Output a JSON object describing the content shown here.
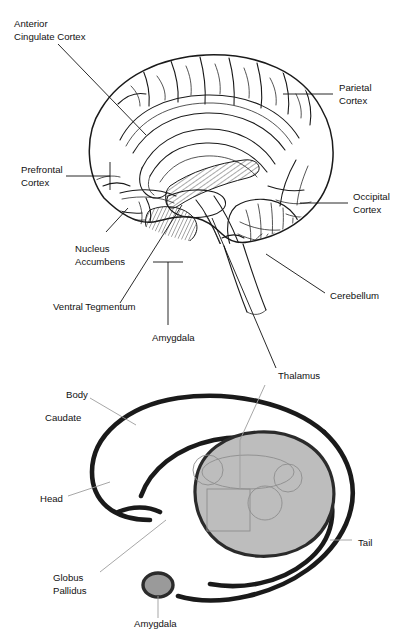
{
  "figure": {
    "caption_partial": "",
    "colors": {
      "ink": "#1a1a1a",
      "leader": "#111111",
      "leader_light": "#9d9d9d",
      "blob_fill": "#bdbdbd",
      "blob_stroke": "#2b2b2b",
      "background": "#ffffff"
    }
  },
  "sagittal": {
    "name": "mid-sagittal-brain",
    "labels": [
      {
        "id": "anterior-cingulate-cortex",
        "line1": "Anterior",
        "line2": "Cingulate Cortex"
      },
      {
        "id": "prefrontal-cortex",
        "line1": "Prefrontal",
        "line2": "Cortex"
      },
      {
        "id": "parietal-cortex",
        "line1": "Parietal",
        "line2": "Cortex"
      },
      {
        "id": "occipital-cortex",
        "line1": "Occipital",
        "line2": "Cortex"
      },
      {
        "id": "nucleus-accumbens",
        "line1": "Nucleus",
        "line2": "Accumbens"
      },
      {
        "id": "ventral-tegmentum",
        "line1": "Ventral Tegmentum",
        "line2": ""
      },
      {
        "id": "amygdala",
        "line1": "Amygdala",
        "line2": ""
      },
      {
        "id": "cerebellum",
        "line1": "Cerebellum",
        "line2": ""
      },
      {
        "id": "thalamus",
        "line1": "Thalamus",
        "line2": ""
      }
    ]
  },
  "basal_ganglia": {
    "name": "basal-ganglia-schematic",
    "labels": [
      {
        "id": "body",
        "line1": "Body",
        "line2": ""
      },
      {
        "id": "caudate",
        "line1": "Caudate",
        "line2": ""
      },
      {
        "id": "head",
        "line1": "Head",
        "line2": ""
      },
      {
        "id": "tail",
        "line1": "Tail",
        "line2": ""
      },
      {
        "id": "globus-pallidus",
        "line1": "Globus",
        "line2": "Pallidus"
      },
      {
        "id": "amygdala",
        "line1": "Amygdala",
        "line2": ""
      }
    ]
  }
}
